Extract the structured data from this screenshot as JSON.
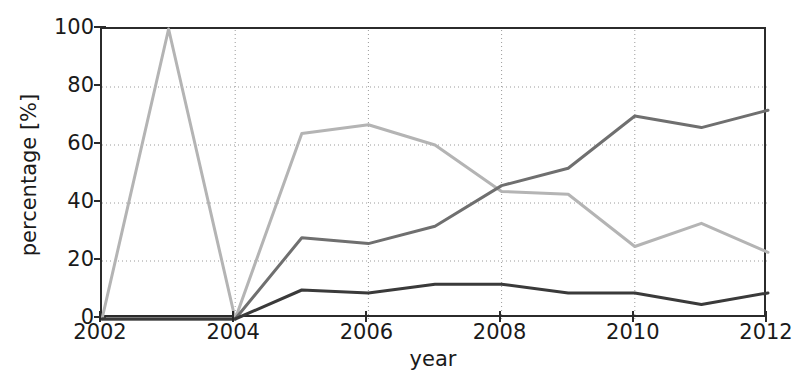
{
  "chart_data": {
    "type": "line",
    "title": "",
    "xlabel": "year",
    "ylabel": "percentage [%]",
    "xlim": [
      2002,
      2012
    ],
    "ylim": [
      0,
      100
    ],
    "grid": true,
    "legend": "none",
    "x": [
      2002,
      2003,
      2004,
      2005,
      2006,
      2007,
      2008,
      2009,
      2010,
      2011,
      2012
    ],
    "xticks": [
      "2002",
      "2004",
      "2006",
      "2008",
      "2010",
      "2012"
    ],
    "xtick_values": [
      2002,
      2004,
      2006,
      2008,
      2010,
      2012
    ],
    "yticks": [
      "0",
      "20",
      "40",
      "60",
      "80",
      "100"
    ],
    "ytick_values": [
      0,
      20,
      40,
      60,
      80,
      100
    ],
    "series": [
      {
        "name": "series-light",
        "color": "#b4b4b4",
        "values": [
          0,
          100,
          0,
          64,
          67,
          60,
          44,
          43,
          25,
          33,
          23
        ]
      },
      {
        "name": "series-medium",
        "color": "#6f6f6f",
        "values": [
          0,
          0,
          0,
          28,
          26,
          32,
          46,
          52,
          70,
          66,
          72
        ]
      },
      {
        "name": "series-dark",
        "color": "#3a3a3a",
        "values": [
          0,
          0,
          0,
          10,
          9,
          12,
          12,
          9,
          9,
          5,
          9
        ]
      }
    ]
  },
  "axes": {
    "ylabel_text": "percentage [%]",
    "xlabel_text": "year"
  }
}
